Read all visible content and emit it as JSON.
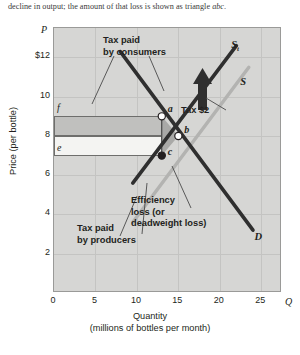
{
  "caption": {
    "text_before": "decline in output; the amount of that loss is shown as triangle ",
    "italic": "abc",
    "text_after": "."
  },
  "chart_data": {
    "type": "line",
    "title": "",
    "xlabel": "Quantity",
    "xlabel_sub": "(millions of bottles per month)",
    "ylabel": "Price (per bottle)",
    "x_axis_symbol": "Q",
    "y_axis_symbol": "P",
    "xlim": [
      0,
      27.5
    ],
    "ylim": [
      0,
      13.5
    ],
    "xticks": [
      "0",
      "5",
      "10",
      "15",
      "20",
      "25"
    ],
    "xtick_values": [
      0,
      5,
      10,
      15,
      20,
      25
    ],
    "yticks": [
      "$12",
      "10",
      "8",
      "6",
      "4",
      "2"
    ],
    "ytick_values": [
      12,
      10,
      8,
      6,
      4,
      2
    ],
    "grid": true,
    "series": [
      {
        "name": "S_t",
        "label": "S",
        "label_sub": "t",
        "type": "supply-with-tax",
        "color": "#2f2f2f",
        "points": [
          [
            9.5,
            5.6
          ],
          [
            22.0,
            12.6
          ]
        ]
      },
      {
        "name": "S",
        "label": "S",
        "type": "supply",
        "color": "#b3b3b1",
        "points": [
          [
            9.5,
            3.6
          ],
          [
            23.5,
            11.5
          ]
        ]
      },
      {
        "name": "D",
        "label": "D",
        "type": "demand",
        "color": "#2f2f2f",
        "points": [
          [
            8.0,
            12.3
          ],
          [
            24.0,
            3.2
          ]
        ]
      }
    ],
    "points": [
      {
        "id": "a",
        "x": 13,
        "y": 9,
        "style": "open",
        "label": "a"
      },
      {
        "id": "b",
        "x": 15,
        "y": 8,
        "style": "open",
        "label": "b"
      },
      {
        "id": "c",
        "x": 13,
        "y": 7,
        "style": "filled",
        "label": "c"
      }
    ],
    "price_markers": [
      {
        "label": "f",
        "y": 9
      },
      {
        "label": "e",
        "y": 7
      }
    ],
    "regions": [
      {
        "name": "tax-paid-by-consumers",
        "label": "Tax paid\nby consumers",
        "x_range": [
          0,
          13
        ],
        "y_range": [
          8,
          9
        ],
        "fill": "#c0c0be"
      },
      {
        "name": "tax-paid-by-producers",
        "label": "Tax paid\nby producers",
        "x_range": [
          0,
          13
        ],
        "y_range": [
          7,
          8
        ],
        "fill": "#f4f4f2"
      },
      {
        "name": "efficiency-loss",
        "label": "Efficiency\nloss (or\ndeadweight loss)",
        "vertices": [
          [
            13,
            9
          ],
          [
            15,
            8
          ],
          [
            13,
            7
          ]
        ],
        "fill": "#a9a9a7"
      }
    ],
    "annotations": [
      {
        "name": "tax-paid-by-consumers-label",
        "line1": "Tax paid",
        "line2": "by consumers"
      },
      {
        "name": "tax-paid-by-producers-label",
        "line1": "Tax paid",
        "line2": "by producers"
      },
      {
        "name": "efficiency-loss-label",
        "line1": "Efficiency",
        "line2": "loss (or",
        "line3": "deadweight loss)"
      },
      {
        "name": "tax-amount-label",
        "text": "Tax $2",
        "value": 2
      }
    ]
  },
  "colors": {
    "plot_background": "#d6d6d4",
    "frame": "#9a9a98",
    "gridline": "#c4c4c2",
    "dark_curve": "#2f2f2f",
    "light_curve": "#b3b3b1",
    "consumer_region": "#c0c0be",
    "producer_region": "#f4f4f2",
    "deadweight_region": "#a9a9a7",
    "text": "#231f20"
  }
}
